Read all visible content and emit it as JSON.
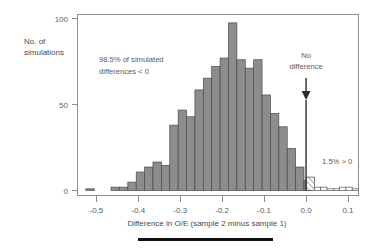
{
  "chart_data": {
    "type": "bar",
    "title": "",
    "subtitle": "",
    "xlabel": "Difference in O/E (sample 2 minus sample  1)",
    "ylabel": "No. of simulations",
    "xlim": [
      -0.545,
      0.125
    ],
    "ylim": [
      0,
      105
    ],
    "xticks": [
      -0.5,
      -0.4,
      -0.3,
      -0.2,
      -0.1,
      0.0,
      0.1
    ],
    "xticklabels": [
      "-0.5",
      "-0.4",
      "-0.3",
      "-0.2",
      "-0.1",
      "0.0",
      "0.1"
    ],
    "yticks": [
      0,
      50,
      100
    ],
    "yticklabels": [
      "0",
      "50",
      "100"
    ],
    "grid": false,
    "legend": null,
    "bin_width": 0.02,
    "bins": [
      {
        "x0": -0.525,
        "value": 1,
        "style": "solid"
      },
      {
        "x0": -0.505,
        "value": 0,
        "style": "solid"
      },
      {
        "x0": -0.485,
        "value": 0,
        "style": "solid"
      },
      {
        "x0": -0.465,
        "value": 2,
        "style": "solid"
      },
      {
        "x0": -0.445,
        "value": 2,
        "style": "solid"
      },
      {
        "x0": -0.425,
        "value": 5,
        "style": "solid"
      },
      {
        "x0": -0.405,
        "value": 11,
        "style": "solid"
      },
      {
        "x0": -0.385,
        "value": 14,
        "style": "solid"
      },
      {
        "x0": -0.365,
        "value": 17,
        "style": "solid"
      },
      {
        "x0": -0.345,
        "value": 15,
        "style": "solid"
      },
      {
        "x0": -0.325,
        "value": 39,
        "style": "solid"
      },
      {
        "x0": -0.305,
        "value": 48,
        "style": "solid"
      },
      {
        "x0": -0.285,
        "value": 44,
        "style": "solid"
      },
      {
        "x0": -0.265,
        "value": 60,
        "style": "solid"
      },
      {
        "x0": -0.245,
        "value": 67,
        "style": "solid"
      },
      {
        "x0": -0.225,
        "value": 74,
        "style": "solid"
      },
      {
        "x0": -0.205,
        "value": 79,
        "style": "solid"
      },
      {
        "x0": -0.185,
        "value": 100,
        "style": "solid"
      },
      {
        "x0": -0.165,
        "value": 78,
        "style": "solid"
      },
      {
        "x0": -0.145,
        "value": 73,
        "style": "solid"
      },
      {
        "x0": -0.125,
        "value": 78,
        "style": "solid"
      },
      {
        "x0": -0.105,
        "value": 57,
        "style": "solid"
      },
      {
        "x0": -0.085,
        "value": 46,
        "style": "solid"
      },
      {
        "x0": -0.065,
        "value": 38,
        "style": "solid"
      },
      {
        "x0": -0.045,
        "value": 25,
        "style": "solid"
      },
      {
        "x0": -0.025,
        "value": 14,
        "style": "solid"
      },
      {
        "x0": -0.005,
        "value": 6,
        "style": "solid"
      },
      {
        "x0": 0.0,
        "value": 8,
        "style": "hatch"
      },
      {
        "x0": 0.02,
        "value": 2,
        "style": "open"
      },
      {
        "x0": 0.035,
        "value": 2,
        "style": "open"
      },
      {
        "x0": 0.05,
        "value": 1,
        "style": "open"
      },
      {
        "x0": 0.065,
        "value": 1,
        "style": "open"
      },
      {
        "x0": 0.08,
        "value": 2,
        "style": "open"
      },
      {
        "x0": 0.095,
        "value": 2,
        "style": "open"
      },
      {
        "x0": 0.11,
        "value": 1,
        "style": "open"
      }
    ],
    "annotations": {
      "left_note_line1": "98.5% of simulated",
      "left_note_line2": "differences < 0",
      "right_note": "1.5% > 0",
      "marker_line1": "No",
      "marker_line2": "difference",
      "marker_x": 0.0
    },
    "colors": {
      "bar_fill": "#8d8d8d",
      "bar_stroke": "#4a4a4a",
      "axis": "#8d8d8d",
      "text": "#5a5a5a",
      "marker": "#2b2b2b",
      "rule": "#111111"
    }
  }
}
